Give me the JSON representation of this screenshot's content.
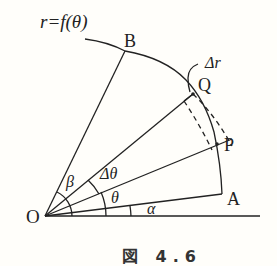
{
  "figure": {
    "curve_label": "r=f(θ)",
    "points": {
      "origin": "O",
      "A": "A",
      "B": "B",
      "P": "P",
      "Q": "Q"
    },
    "angles": {
      "alpha": "α",
      "theta": "θ",
      "delta_theta": "Δθ",
      "beta": "β"
    },
    "arc_length_label": "Δr",
    "caption": "図 4.6"
  }
}
